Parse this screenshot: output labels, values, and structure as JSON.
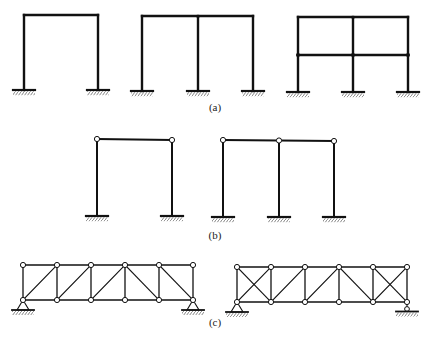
{
  "figure": {
    "panels": [
      {
        "id": "a",
        "label": "(a)",
        "description": "Rigid frames with fixed supports",
        "frames": [
          {
            "columns": [
              24,
              98
            ],
            "levels": [
              15
            ],
            "base": 90,
            "joints": "rigid"
          },
          {
            "columns": [
              142,
              198,
              253
            ],
            "levels": [
              16
            ],
            "base": 91,
            "joints": "rigid"
          },
          {
            "columns": [
              298,
              353,
              408
            ],
            "levels": [
              17,
              55
            ],
            "base": 92,
            "joints": "rigid"
          }
        ],
        "label_pos": [
          215,
          111
        ]
      },
      {
        "id": "b",
        "label": "(b)",
        "description": "Frames with pinned beam-column joints and fixed supports",
        "frames": [
          {
            "columns": [
              97,
              172
            ],
            "levels": [
              139
            ],
            "base": 216,
            "joints": "hinged"
          },
          {
            "columns": [
              223,
              279,
              334
            ],
            "levels": [
              140
            ],
            "base": 217,
            "joints": "hinged"
          }
        ],
        "label_pos": [
          215,
          239
        ]
      },
      {
        "id": "c",
        "label": "(c)",
        "description": "Pin-jointed trusses with pin and roller supports",
        "trusses": [
          {
            "nodes_x": [
              23,
              57,
              91,
              125,
              159,
              193
            ],
            "top": 265,
            "bottom": 300,
            "diagonals": [
              [
                0,
                "b",
                1,
                "t"
              ],
              [
                1,
                "b",
                2,
                "t"
              ],
              [
                2,
                "b",
                3,
                "t"
              ],
              [
                3,
                "t",
                4,
                "b"
              ],
              [
                4,
                "t",
                5,
                "b"
              ]
            ],
            "supports": [
              {
                "node": 0,
                "type": "pin"
              },
              {
                "node": 5,
                "type": "pin"
              }
            ]
          },
          {
            "nodes_x": [
              237,
              271,
              305,
              339,
              373,
              407
            ],
            "top": 267,
            "bottom": 302,
            "diagonals": [
              [
                0,
                "b",
                1,
                "t"
              ],
              [
                0,
                "t",
                1,
                "b"
              ],
              [
                1,
                "b",
                2,
                "t"
              ],
              [
                2,
                "b",
                3,
                "t"
              ],
              [
                3,
                "t",
                4,
                "b"
              ],
              [
                4,
                "t",
                5,
                "b"
              ],
              [
                4,
                "b",
                5,
                "t"
              ]
            ],
            "supports": [
              {
                "node": 0,
                "type": "pin"
              },
              {
                "node": 5,
                "type": "roller"
              }
            ]
          }
        ],
        "label_pos": [
          215,
          326
        ]
      }
    ]
  },
  "labels": {
    "a": "(a)",
    "b": "(b)",
    "c": "(c)"
  },
  "colors": {
    "line": "#111111",
    "hatch": "#555555",
    "background": "#ffffff"
  }
}
